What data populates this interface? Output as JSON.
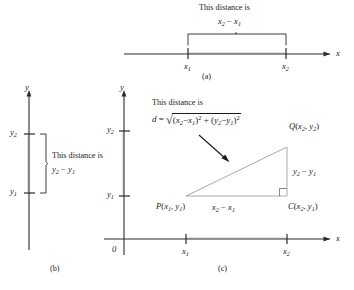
{
  "figure": {
    "caption_a": "(a)",
    "caption_b": "(b)",
    "caption_c": "(c)"
  },
  "panel_a": {
    "axis_label_x": "x",
    "note_line1": "This distance is",
    "note_line2_base": "x",
    "note_line2_sub1": "2",
    "note_line2_op": " − ",
    "note_line2_base2": "x",
    "note_line2_sub2": "1",
    "note_line2_full": "x₂ − x₁",
    "tick_label_1": "x",
    "tick_sub_1": "1",
    "tick_label_2": "x",
    "tick_sub_2": "2"
  },
  "panel_b": {
    "axis_label_y": "y",
    "tick_label_upper": "y",
    "tick_sub_upper": "2",
    "tick_label_lower": "y",
    "tick_sub_lower": "1",
    "note_line1": "This distance is",
    "note_line2_full": "y₂ − y₁",
    "note_base_a": "y",
    "note_sub_a": "2",
    "note_op": " − ",
    "note_base_b": "y",
    "note_sub_b": "1"
  },
  "panel_c": {
    "axis_label_x": "x",
    "axis_label_y": "y",
    "origin_label": "0",
    "xtick_1_base": "x",
    "xtick_1_sub": "1",
    "xtick_2_base": "x",
    "xtick_2_sub": "2",
    "ytick_1_base": "y",
    "ytick_1_sub": "1",
    "ytick_2_base": "y",
    "ytick_2_sub": "2",
    "note_line1": "This distance is",
    "formula_lhs": "d",
    "formula_eq": " = ",
    "formula_radical": "√",
    "formula_body": "(x₂ − x₁)² + (y₂ − y₁)²",
    "formula_full": "d = √((x₂ − x₁)² + (y₂ − y₁)²)",
    "point_P": "P(x₁, y₁)",
    "point_P_name": "P",
    "point_Q": "Q(x₂, y₂)",
    "point_Q_name": "Q",
    "point_C": "C(x₂, y₁)",
    "point_C_name": "C",
    "side_base_label": "x₂ − x₁",
    "side_vertical_label": "y₂ − y₁"
  },
  "colors": {
    "ink": "#1a1a1a",
    "axis": "#2b2b2b",
    "triangle": "#8d8d8d",
    "background": "#ffffff"
  }
}
